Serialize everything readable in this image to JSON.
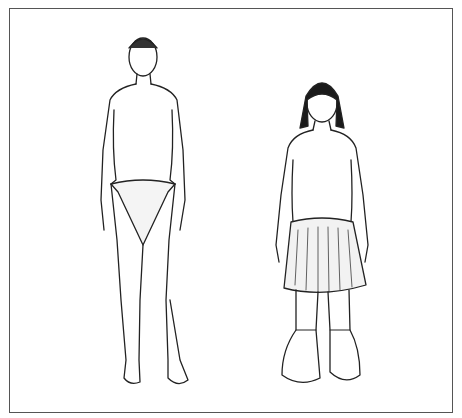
{
  "illustration": {
    "type": "line drawing",
    "frame": {
      "left": 9,
      "top": 8,
      "right": 453,
      "bottom": 413,
      "stroke": "#555555"
    },
    "figures": [
      {
        "id": "figure-left",
        "description": "standing figure, short hair, wearing a loincloth, barefoot",
        "center_x": 148
      },
      {
        "id": "figure-right",
        "description": "standing figure, long dark hair, wearing a fringed grass skirt and soft boots",
        "center_x": 322
      }
    ],
    "colors": {
      "ink": "#222222",
      "paper": "#ffffff",
      "hair": "#1a1a1a"
    }
  }
}
